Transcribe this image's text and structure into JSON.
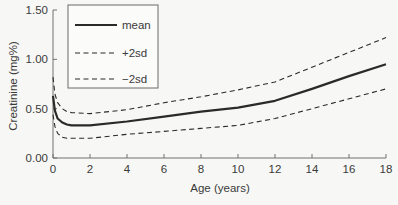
{
  "chart_data": {
    "type": "line",
    "title": "",
    "xlabel": "Age (years)",
    "ylabel": "Creatinine (mg%)",
    "xlim": [
      0,
      18
    ],
    "ylim": [
      0,
      1.5
    ],
    "x_ticks": [
      0,
      2,
      4,
      6,
      8,
      10,
      12,
      14,
      16,
      18
    ],
    "x_tick_labels": [
      "0",
      "2",
      "4",
      "6",
      "8",
      "10",
      "12",
      "14",
      "16",
      "18"
    ],
    "y_ticks": [
      0,
      0.5,
      1.0,
      1.5
    ],
    "y_tick_labels": [
      "0.00",
      "0.50",
      "1.00",
      "1.50"
    ],
    "grid": false,
    "legend_position": "upper-left (inset box)",
    "x": [
      0,
      0.1,
      0.25,
      0.5,
      0.75,
      1,
      2,
      4,
      6,
      8,
      10,
      12,
      14,
      16,
      18
    ],
    "series": [
      {
        "name": "mean",
        "style": "solid",
        "values": [
          0.63,
          0.48,
          0.4,
          0.36,
          0.34,
          0.33,
          0.33,
          0.37,
          0.42,
          0.47,
          0.51,
          0.58,
          0.7,
          0.83,
          0.95
        ]
      },
      {
        "name": "+2sd",
        "style": "dashed",
        "values": [
          0.82,
          0.65,
          0.56,
          0.5,
          0.47,
          0.46,
          0.45,
          0.49,
          0.56,
          0.62,
          0.69,
          0.77,
          0.92,
          1.07,
          1.22
        ]
      },
      {
        "name": "−2sd",
        "style": "dashed",
        "values": [
          0.44,
          0.32,
          0.25,
          0.21,
          0.2,
          0.2,
          0.2,
          0.24,
          0.27,
          0.3,
          0.33,
          0.4,
          0.5,
          0.6,
          0.7
        ]
      }
    ]
  },
  "legend": {
    "items": [
      {
        "label": "mean",
        "style": "solid"
      },
      {
        "label": "+2sd",
        "style": "dashed"
      },
      {
        "label": "−2sd",
        "style": "dashed"
      }
    ]
  },
  "colors": {
    "line": "#2a2a2a",
    "axis": "#707070",
    "background": "#f7f7f5"
  }
}
